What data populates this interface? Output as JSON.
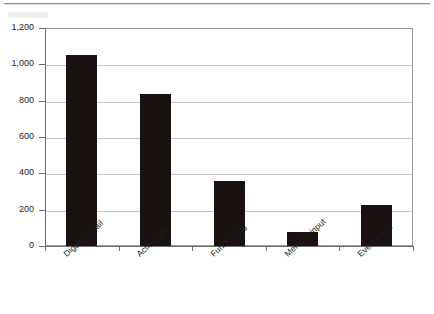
{
  "page": {
    "background_color": "#ffffff",
    "rule_color": "#8f8f8f"
  },
  "chart_data": {
    "type": "bar",
    "title": "",
    "subtitle": "",
    "xlabel": "",
    "ylabel": "",
    "categories": [
      "Digest/e-mail",
      "Action ask",
      "Fundraising",
      "Member input",
      "Event invite"
    ],
    "values": [
      1050,
      835,
      357,
      75,
      225
    ],
    "series": [
      {
        "name": "",
        "values": [
          1050,
          835,
          357,
          75,
          225
        ]
      }
    ],
    "ylim": [
      0,
      1200
    ],
    "y_ticks": [
      0,
      200,
      400,
      600,
      800,
      1000,
      1200
    ],
    "y_tick_labels": [
      "0",
      "200",
      "400",
      "600",
      "800",
      "1,000",
      "1,200"
    ],
    "grid": true,
    "grid_axis": "y",
    "legend": false,
    "legend_position": "none",
    "bar_color": "#1a1210",
    "gridline_color": "#c4c4c4",
    "axis_color": "#6d6d6d",
    "plot_background": "#ffffff",
    "x_tick_label_rotation": -42,
    "annotations": []
  }
}
